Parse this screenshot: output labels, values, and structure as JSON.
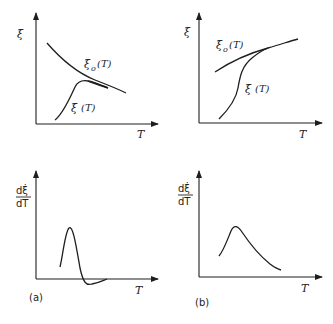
{
  "figure": {
    "panels": [
      {
        "id": "a-top",
        "y_label": "ξ̇",
        "x_label": "T",
        "curves": [
          {
            "name": "xi0",
            "label": "ξ̇₀(T)",
            "description": "decreasing curve"
          },
          {
            "name": "xi",
            "label": "ξ̇ (T)",
            "description": "rising curve with overshoot peak, merging into ξ̇₀(T)"
          }
        ]
      },
      {
        "id": "b-top",
        "y_label": "ξ̇",
        "x_label": "T",
        "curves": [
          {
            "name": "xi0",
            "label": "ξ̇₀(T)",
            "description": "slowly increasing curve"
          },
          {
            "name": "xi",
            "label": "ξ̇ (T)",
            "description": "S-shaped rising curve approaching ξ̇₀(T) from below"
          }
        ]
      },
      {
        "id": "a-bottom",
        "y_label_num": "dξ̇",
        "y_label_den": "dT",
        "x_label": "T",
        "caption": "(a)",
        "curves": [
          {
            "name": "derivative",
            "description": "sharp peak then dips below zero"
          }
        ]
      },
      {
        "id": "b-bottom",
        "y_label_num": "dξ̇",
        "y_label_den": "dT",
        "x_label": "T",
        "caption": "(b)",
        "curves": [
          {
            "name": "derivative",
            "description": "peak followed by slow decay"
          }
        ]
      }
    ]
  },
  "labels": {
    "xi_dot": "ξ̇",
    "T": "T",
    "xi0_T_main": "ξ̇",
    "xi0_T_sub": "o",
    "xi0_T_arg": "(T)",
    "xi_T_main": "ξ̇",
    "xi_T_arg": "(T)",
    "deriv_num": "dξ̇",
    "deriv_den": "dT",
    "caption_a": "(a)",
    "caption_b": "(b)"
  },
  "colors": {
    "ink": "#1e1e1e",
    "background": "#ffffff"
  }
}
